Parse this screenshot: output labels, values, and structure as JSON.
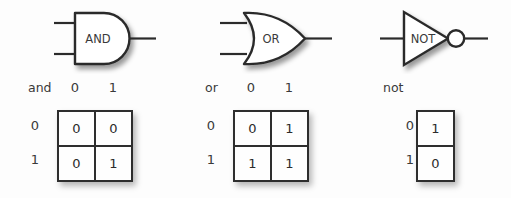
{
  "figure": {
    "background_color": "#fdfdfd",
    "ink_color": "#2b2b2b",
    "gate_fill": "#ffffff"
  },
  "gates": [
    {
      "id": "and",
      "symbol_label": "AND",
      "symbol_shape": "and-gate-shape",
      "inputs": 2,
      "inverted_output": false,
      "table": {
        "operator_label": "and",
        "column_headers": [
          "0",
          "1"
        ],
        "row_headers": [
          "0",
          "1"
        ],
        "cells": [
          [
            "0",
            "0"
          ],
          [
            "0",
            "1"
          ]
        ]
      }
    },
    {
      "id": "or",
      "symbol_label": "OR",
      "symbol_shape": "or-gate-shape",
      "inputs": 2,
      "inverted_output": false,
      "table": {
        "operator_label": "or",
        "column_headers": [
          "0",
          "1"
        ],
        "row_headers": [
          "0",
          "1"
        ],
        "cells": [
          [
            "0",
            "1"
          ],
          [
            "1",
            "1"
          ]
        ]
      }
    },
    {
      "id": "not",
      "symbol_label": "NOT",
      "symbol_shape": "not-gate-shape",
      "inputs": 1,
      "inverted_output": true,
      "table": {
        "operator_label": "not",
        "column_headers": [],
        "row_headers": [
          "0",
          "1"
        ],
        "cells": [
          [
            "1"
          ],
          [
            "0"
          ]
        ]
      }
    }
  ]
}
